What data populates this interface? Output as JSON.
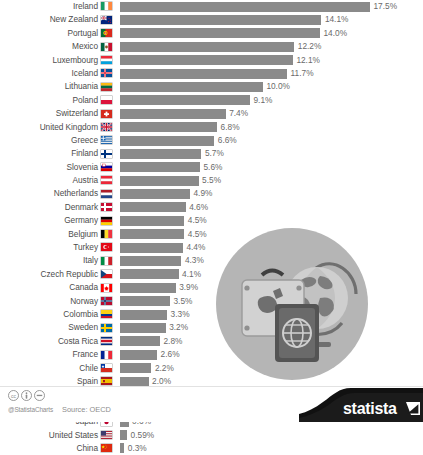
{
  "footer": {
    "handle": "@StatistaCharts",
    "source": "Source: OECD",
    "logo_text": "statista",
    "cc_icons": [
      "creative-commons-icon",
      "attribution-icon",
      "no-derivatives-icon"
    ]
  },
  "illustration": {
    "name": "travel-passport-globe-illustration",
    "elements": [
      "suitcase",
      "globe-on-stand",
      "passport"
    ]
  },
  "chart_data": {
    "type": "bar",
    "title": "",
    "subtitle": "",
    "xlabel": "",
    "ylabel": "",
    "orientation": "horizontal",
    "grid": false,
    "legend": false,
    "value_suffix": "%",
    "xlim": [
      0,
      17.5
    ],
    "bar_color": "#8a8a8a",
    "categories": [
      "Ireland",
      "New Zealand",
      "Portugal",
      "Mexico",
      "Luxembourg",
      "Iceland",
      "Lithuania",
      "Poland",
      "Switzerland",
      "United Kingdom",
      "Greece",
      "Finland",
      "Slovenia",
      "Austria",
      "Netherlands",
      "Denmark",
      "Germany",
      "Belgium",
      "Turkey",
      "Italy",
      "Czech Republic",
      "Canada",
      "Norway",
      "Colombia",
      "Sweden",
      "Costa Rica",
      "France",
      "Chile",
      "Spain",
      "Australia",
      "Brazil",
      "Japan",
      "United States",
      "China"
    ],
    "values": [
      17.5,
      14.1,
      14.0,
      12.2,
      12.1,
      11.7,
      10.0,
      9.1,
      7.4,
      6.8,
      6.6,
      5.7,
      5.6,
      5.5,
      4.9,
      4.6,
      4.5,
      4.5,
      4.4,
      4.3,
      4.1,
      3.9,
      3.5,
      3.3,
      3.2,
      2.8,
      2.6,
      2.2,
      2.0,
      2.0,
      0.7,
      0.6,
      0.5,
      0.3
    ],
    "labels": [
      "17.5%",
      "14.1%",
      "14.0%",
      "12.2%",
      "12.1%",
      "11.7%",
      "10.0%",
      "9.1%",
      "7.4%",
      "6.8%",
      "6.6%",
      "5.7%",
      "5.6%",
      "5.5%",
      "4.9%",
      "4.6%",
      "4.5%",
      "4.5%",
      "4.4%",
      "4.3%",
      "4.1%",
      "3.9%",
      "3.5%",
      "3.3%",
      "3.2%",
      "2.8%",
      "2.6%",
      "2.2%",
      "2.0%",
      "2.0%",
      "0.7%",
      "0.6%",
      "0.59%",
      "0.3%"
    ],
    "flags": [
      "ireland",
      "new-zealand",
      "portugal",
      "mexico",
      "luxembourg",
      "iceland",
      "lithuania",
      "poland",
      "switzerland",
      "united-kingdom",
      "greece",
      "finland",
      "slovenia",
      "austria",
      "netherlands",
      "denmark",
      "germany",
      "belgium",
      "turkey",
      "italy",
      "czech-republic",
      "canada",
      "norway",
      "colombia",
      "sweden",
      "costa-rica",
      "france",
      "chile",
      "spain",
      "australia",
      "brazil",
      "japan",
      "united-states",
      "china"
    ]
  }
}
